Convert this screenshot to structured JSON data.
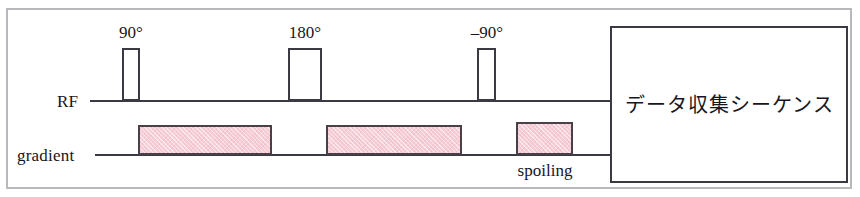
{
  "figure": {
    "type": "mri-pulse-sequence-diagram",
    "frame_color": "#b9b9bd",
    "line_color": "#3a3a42",
    "gradient_fill_color": "#f6ced7"
  },
  "axes": {
    "rf": {
      "label": "RF"
    },
    "gradient": {
      "label": "gradient"
    }
  },
  "rf_pulses": [
    {
      "caption": "90°"
    },
    {
      "caption": "180°"
    },
    {
      "caption": "–90°"
    }
  ],
  "gradient_blocks": [
    {
      "caption": ""
    },
    {
      "caption": ""
    },
    {
      "caption": "spoiling"
    }
  ],
  "acquisition_box": {
    "label": "データ収集シーケンス"
  }
}
